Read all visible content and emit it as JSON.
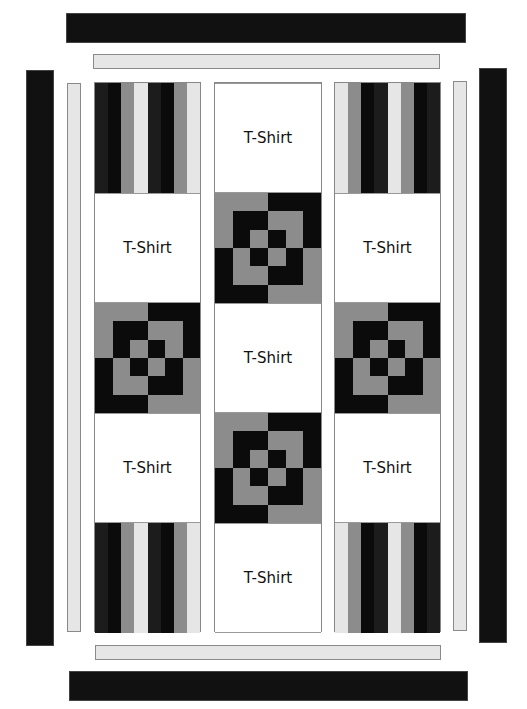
{
  "colors": {
    "black": "#0b0b0b",
    "dark": "#1c1c1c",
    "gray": "#8c8c8c",
    "light": "#e6e6e6",
    "white": "#ffffff"
  },
  "block_label": "T-Shirt",
  "columns": [
    {
      "name": "left-column",
      "blocks": [
        {
          "type": "strips",
          "pattern": [
            "dark",
            "black",
            "gray",
            "light",
            "dark",
            "black",
            "gray",
            "light"
          ]
        },
        {
          "type": "tshirt",
          "label": "T-Shirt"
        },
        {
          "type": "pinwheel"
        },
        {
          "type": "tshirt",
          "label": "T-Shirt"
        },
        {
          "type": "strips",
          "pattern": [
            "dark",
            "black",
            "gray",
            "light",
            "dark",
            "black",
            "gray",
            "light"
          ]
        }
      ]
    },
    {
      "name": "center-column",
      "blocks": [
        {
          "type": "tshirt",
          "label": "T-Shirt"
        },
        {
          "type": "pinwheel"
        },
        {
          "type": "tshirt",
          "label": "T-Shirt"
        },
        {
          "type": "pinwheel"
        },
        {
          "type": "tshirt",
          "label": "T-Shirt"
        }
      ]
    },
    {
      "name": "right-column",
      "blocks": [
        {
          "type": "strips",
          "pattern": [
            "light",
            "gray",
            "black",
            "dark",
            "light",
            "gray",
            "black",
            "dark"
          ]
        },
        {
          "type": "tshirt",
          "label": "T-Shirt"
        },
        {
          "type": "pinwheel"
        },
        {
          "type": "tshirt",
          "label": "T-Shirt"
        },
        {
          "type": "strips",
          "pattern": [
            "light",
            "gray",
            "black",
            "dark",
            "light",
            "gray",
            "black",
            "dark"
          ]
        }
      ]
    }
  ],
  "pinwheel_grid": [
    [
      "gray",
      "gray",
      "gray",
      "black",
      "black",
      "black"
    ],
    [
      "gray",
      "black",
      "black",
      "gray",
      "gray",
      "black"
    ],
    [
      "gray",
      "black",
      "gray",
      "black",
      "gray",
      "black"
    ],
    [
      "black",
      "gray",
      "black",
      "gray",
      "black",
      "gray"
    ],
    [
      "black",
      "gray",
      "gray",
      "black",
      "black",
      "gray"
    ],
    [
      "black",
      "black",
      "black",
      "gray",
      "gray",
      "gray"
    ]
  ],
  "borders": {
    "top_dark": "outer top border (black)",
    "top_light": "inner top border (light gray)",
    "bottom_light": "inner bottom border (light gray)",
    "bottom_dark": "outer bottom border (black)",
    "left_dark": "outer left border (black)",
    "left_light": "inner left border (light gray)",
    "right_light": "inner right border (light gray)",
    "right_dark": "outer right border (black)"
  }
}
